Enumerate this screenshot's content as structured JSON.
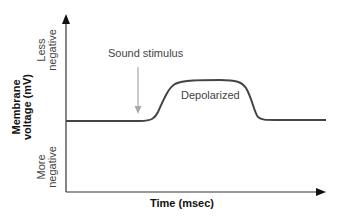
{
  "diagram": {
    "yaxis_label_line1": "Membrane",
    "yaxis_label_line2": "voltage (mV)",
    "y_top_line1": "Less",
    "y_top_line2": "negative",
    "y_bottom_line1": "More",
    "y_bottom_line2": "negative",
    "xaxis_label": "Time (msec)",
    "stimulus_label": "Sound stimulus",
    "plateau_label": "Depolarized",
    "colors": {
      "trace": "#444444",
      "axis": "#333333",
      "stimulus_arrow": "#aaaaaa"
    }
  }
}
